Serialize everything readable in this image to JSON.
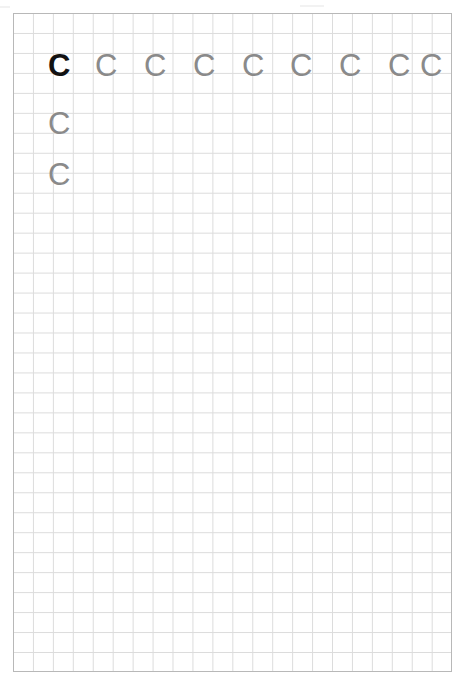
{
  "document": {
    "kind": "handwriting-practice-worksheet",
    "title": "Letter C tracing practice sheet",
    "paper": {
      "background_color": "#ffffff",
      "width_px": 469,
      "height_px": 683
    },
    "grid": {
      "type": "square-grid",
      "cell_size_px": 20,
      "columns": 22,
      "rows": 33,
      "line_color": "#dcdcdc",
      "border_color": "#b8b8b8",
      "left_px": 13,
      "top_px": 13,
      "width_px": 439,
      "height_px": 659
    },
    "letter": "C",
    "colors": {
      "model_letter": "#121212",
      "trace_letter": "#8a8a8a"
    },
    "rows": [
      {
        "row_index": 1,
        "top_px": 36,
        "letters": [
          {
            "char": "C",
            "style": "model",
            "x_px": 34
          },
          {
            "char": "C",
            "style": "trace",
            "x_px": 81
          },
          {
            "char": "C",
            "style": "trace",
            "x_px": 130
          },
          {
            "char": "C",
            "style": "trace",
            "x_px": 179
          },
          {
            "char": "C",
            "style": "trace",
            "x_px": 228
          },
          {
            "char": "C",
            "style": "trace",
            "x_px": 276
          },
          {
            "char": "C",
            "style": "trace",
            "x_px": 325
          },
          {
            "char": "C",
            "style": "trace",
            "x_px": 374
          },
          {
            "char": "C",
            "style": "trace",
            "x_px": 406
          }
        ]
      },
      {
        "row_index": 2,
        "top_px": 94,
        "letters": [
          {
            "char": "C",
            "style": "trace",
            "x_px": 34
          }
        ]
      },
      {
        "row_index": 3,
        "top_px": 145,
        "letters": [
          {
            "char": "C",
            "style": "trace",
            "x_px": 34
          }
        ]
      }
    ]
  }
}
